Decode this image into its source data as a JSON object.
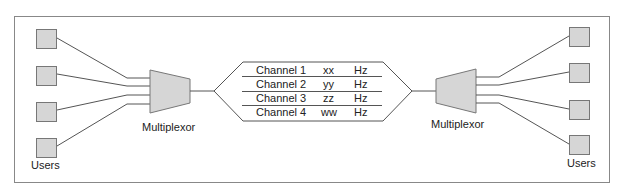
{
  "diagram": {
    "left": {
      "users_label": "Users",
      "mux_label": "Multiplexor",
      "user_count": 4
    },
    "right": {
      "users_label": "Users",
      "mux_label": "Multiplexor",
      "user_count": 4
    },
    "channels": [
      {
        "name": "Channel 1",
        "value": "xx",
        "unit": "Hz"
      },
      {
        "name": "Channel 2",
        "value": "yy",
        "unit": "Hz"
      },
      {
        "name": "Channel 3",
        "value": "zz",
        "unit": "Hz"
      },
      {
        "name": "Channel 4",
        "value": "ww",
        "unit": "Hz"
      }
    ],
    "colors": {
      "box_fill": "#d6d6d6",
      "stroke": "#555555",
      "frame": "#888888"
    }
  }
}
